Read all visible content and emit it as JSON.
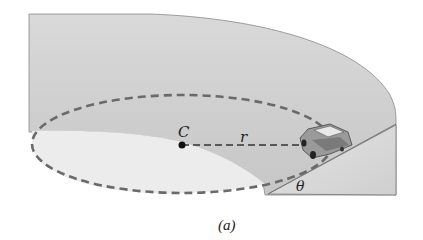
{
  "figure": {
    "caption": "(a)",
    "labels": {
      "center": "C",
      "radius": "r",
      "bank_angle": "θ"
    },
    "elements": [
      "banked-track-surface",
      "circular-path-dashed",
      "center-point",
      "radius-line",
      "car",
      "bank-cross-section"
    ]
  },
  "colors": {
    "track_outer": "#cfcfcf",
    "track_inner": "#bdbdbd",
    "ground": "#e6e6e6",
    "dash": "#6a6a6a",
    "outline": "#777777"
  }
}
